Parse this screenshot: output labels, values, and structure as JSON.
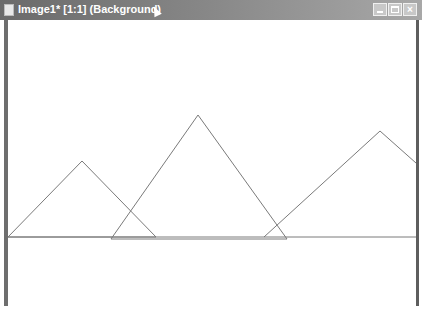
{
  "window": {
    "title": "Image1* [1:1] (Background)",
    "buttons": {
      "minimize": "_",
      "maximize": "□",
      "close": "×"
    }
  },
  "canvas": {
    "stroke_color": "#7a7a7a",
    "baseline": {
      "x1": 8,
      "y1": 237,
      "x2": 416,
      "y2": 237
    },
    "triangles": [
      {
        "name": "left",
        "points": "8,237 82,161 156,237"
      },
      {
        "name": "middle",
        "points": "111,239 198,115 287,239"
      },
      {
        "name": "right",
        "points": "264,237 380,131 416,163"
      }
    ]
  },
  "status": {
    "text": ""
  }
}
